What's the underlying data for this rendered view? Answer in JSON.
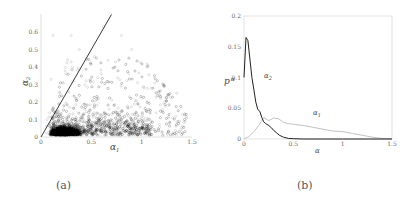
{
  "captions": {
    "a": "(a)",
    "b": "(b)"
  },
  "chart_data": [
    {
      "id": "a",
      "type": "scatter",
      "title": "",
      "xlabel": "α1",
      "ylabel": "α2",
      "xlim": [
        0,
        1.5
      ],
      "ylim": [
        0,
        0.65
      ],
      "xticks": [
        "0",
        "0.5",
        "1",
        "1.5"
      ],
      "yticks": [
        "0",
        "0.1",
        "0.2",
        "0.3",
        "0.4",
        "0.5",
        "0.6"
      ],
      "grid": false,
      "legend": null,
      "description": "Dense cloud of several thousand semi-transparent points concentrated near α1≈0.1–0.6, α2≈0–0.15, spreading to α1≈1.45 and α2≈0.6; all points lie below/right of the line α2 = 0.85·α1",
      "reference_line": {
        "type": "line",
        "x": [
          0,
          0.7
        ],
        "y": [
          0,
          0.7
        ],
        "label": ""
      },
      "cluster_hints": {
        "dense_core": {
          "x": [
            0.1,
            0.6
          ],
          "y": [
            0.0,
            0.12
          ]
        },
        "spread": {
          "x": [
            0.05,
            1.45
          ],
          "y": [
            0.0,
            0.6
          ]
        }
      }
    },
    {
      "id": "b",
      "type": "line",
      "title": "",
      "xlabel": "α",
      "ylabel": "p α",
      "xlim": [
        0,
        1.5
      ],
      "ylim": [
        0,
        0.2
      ],
      "xticks": [
        "0",
        "0.5",
        "1",
        "1.5"
      ],
      "yticks": [
        "0",
        "0.05",
        "0.1",
        "0.15",
        "0.2"
      ],
      "grid": false,
      "legend": null,
      "annotations": [
        {
          "text": "α2",
          "x": 0.2,
          "y": 0.1
        },
        {
          "text": "α1",
          "x": 0.7,
          "y": 0.04
        }
      ],
      "series": [
        {
          "name": "α2",
          "color": "#222222",
          "x": [
            0.0,
            0.02,
            0.04,
            0.06,
            0.08,
            0.1,
            0.12,
            0.14,
            0.16,
            0.18,
            0.2,
            0.22,
            0.25,
            0.28,
            0.3,
            0.33,
            0.36,
            0.4,
            0.45,
            0.5,
            0.6,
            0.8,
            1.0,
            1.5
          ],
          "y": [
            0.1,
            0.165,
            0.16,
            0.13,
            0.1,
            0.08,
            0.06,
            0.048,
            0.045,
            0.035,
            0.028,
            0.025,
            0.022,
            0.018,
            0.014,
            0.01,
            0.006,
            0.003,
            0.001,
            0.0005,
            0.0,
            0.0,
            0.0,
            0.0
          ]
        },
        {
          "name": "α1",
          "color": "#bbbbbb",
          "x": [
            0.0,
            0.05,
            0.1,
            0.15,
            0.18,
            0.2,
            0.25,
            0.3,
            0.35,
            0.4,
            0.45,
            0.5,
            0.6,
            0.7,
            0.8,
            0.9,
            1.0,
            1.1,
            1.2,
            1.3,
            1.4,
            1.5
          ],
          "y": [
            0.0,
            0.004,
            0.012,
            0.022,
            0.03,
            0.035,
            0.03,
            0.034,
            0.033,
            0.027,
            0.025,
            0.024,
            0.022,
            0.019,
            0.016,
            0.013,
            0.012,
            0.009,
            0.006,
            0.003,
            0.001,
            0.0
          ]
        }
      ]
    }
  ]
}
